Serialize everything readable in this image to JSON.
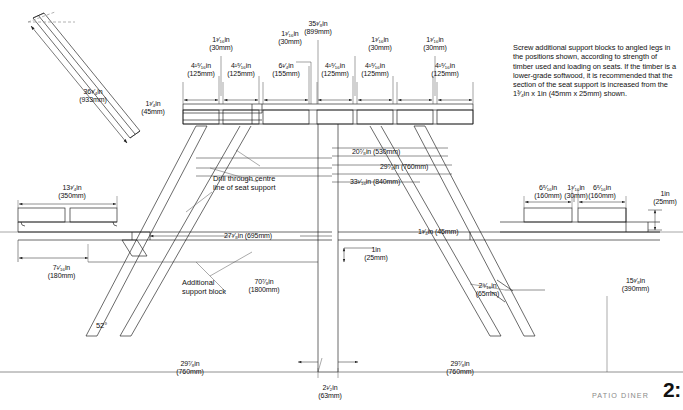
{
  "document": {
    "title": "Picnic table construction drawing",
    "footer_brand": "PATIO DINER",
    "page_number": "2:"
  },
  "note": {
    "text": "Screw additional support blocks to angled legs in the positions shown, according to strength of timber used and loading on seats. If the timber is a lower-grade softwood, it is recommended that the section of the seat support is increased from the 1³⁄₄in x 1in (45mm x 25mm) shown."
  },
  "callouts": [
    {
      "id": "drill-centre-line",
      "line1": "Drill through centre",
      "line2": "line of seat support"
    },
    {
      "id": "additional-support-block",
      "line1": "Additional",
      "line2": "support block"
    }
  ],
  "angle": {
    "value": "52°"
  },
  "dimensions": {
    "diagonal_plank_length": {
      "imperial": "36³⁄₄in",
      "metric": "(933mm)"
    },
    "top_slat_thickness": {
      "imperial": "1³⁄₄in",
      "metric": "(45mm)"
    },
    "table_height": {
      "imperial": "35³⁄₈in",
      "metric": "(899mm)"
    },
    "slat_width_125_a": {
      "imperial": "4¹⁵⁄₁₆in",
      "metric": "(125mm)"
    },
    "slat_width_125_b": {
      "imperial": "4¹⁵⁄₁₆in",
      "metric": "(125mm)"
    },
    "slat_width_155": {
      "imperial": "6¹⁄₄in",
      "metric": "(155mm)"
    },
    "slat_width_125_c": {
      "imperial": "4¹⁵⁄₁₆in",
      "metric": "(125mm)"
    },
    "slat_width_125_d": {
      "imperial": "4¹⁵⁄₁₆in",
      "metric": "(125mm)"
    },
    "slat_width_125_e": {
      "imperial": "4¹⁵⁄₁₆in",
      "metric": "(125mm)"
    },
    "gap_30_a": {
      "imperial": "1³⁄₁₆in",
      "metric": "(30mm)"
    },
    "gap_30_b": {
      "imperial": "1³⁄₁₆in",
      "metric": "(30mm)"
    },
    "gap_30_c": {
      "imperial": "1³⁄₁₆in",
      "metric": "(30mm)"
    },
    "gap_30_d": {
      "imperial": "1³⁄₁₆in",
      "metric": "(30mm)"
    },
    "seat_width_350": {
      "imperial": "13³⁄₄in",
      "metric": "(350mm)"
    },
    "brace_530": {
      "text": "20⁷⁄₈in (530mm)"
    },
    "brace_760_mid": {
      "text": "29⁷⁄₈in (760mm)"
    },
    "brace_840": {
      "text": "33¹⁄₁₆in (840mm)"
    },
    "seat_overhang_180": {
      "imperial": "7¹⁄₁₆in",
      "metric": "(180mm)"
    },
    "seat_support_695": {
      "text": "27³⁄₈in (695mm)"
    },
    "seat_support_thickness_45": {
      "text": "1³⁄₄in (45mm)"
    },
    "leg_spread_1800": {
      "imperial": "70⁷⁄₈in",
      "metric": "(1800mm)"
    },
    "leg_thickness_25_left": {
      "imperial": "1in",
      "metric": "(25mm)"
    },
    "leg_thickness_25_right": {
      "imperial": "1in",
      "metric": "(25mm)"
    },
    "seat_slat_160_a": {
      "imperial": "6⁵⁄₁₆in",
      "metric": "(160mm)"
    },
    "seat_gap_30_right": {
      "imperial": "1³⁄₁₆in",
      "metric": "(30mm)"
    },
    "seat_slat_160_b": {
      "imperial": "6⁵⁄₁₆in",
      "metric": "(160mm)"
    },
    "support_block_65": {
      "imperial": "2⁹⁄₁₆in",
      "metric": "(65mm)"
    },
    "seat_height_390": {
      "imperial": "15³⁄₈in",
      "metric": "(390mm)"
    },
    "base_760_left": {
      "imperial": "29⁷⁄₈in",
      "metric": "(760mm)"
    },
    "base_760_right": {
      "imperial": "29⁷⁄₈in",
      "metric": "(760mm)"
    },
    "leg_width_63": {
      "imperial": "2¹⁄₂in",
      "metric": "(63mm)"
    }
  },
  "colors": {
    "line": "#1a1a1a",
    "thin_line": "#555555",
    "dim_line": "#333333",
    "paper": "#ffffff",
    "brand_grey": "#8a8a8a"
  }
}
